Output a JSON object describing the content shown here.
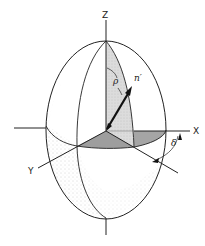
{
  "diagram": {
    "labels": {
      "z_axis": "Z",
      "x_axis": "X",
      "y_axis": "Y",
      "rho": "ρ",
      "normal": "n′",
      "delta": "δ"
    },
    "colors": {
      "line": "#222222",
      "shaded_light": "#d8d8d8",
      "shaded_dark": "#9a9a9a",
      "stipple": "#b5b5b5",
      "background": "#ffffff"
    }
  }
}
